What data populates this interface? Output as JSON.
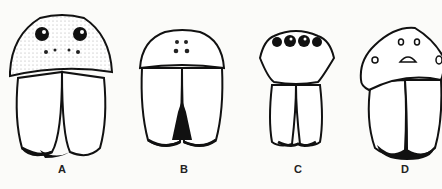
{
  "figure": {
    "panels": [
      {
        "label": "A",
        "description": "spider face with large anterior median eyes and chelicerae"
      },
      {
        "label": "B",
        "description": "spider face with small eyes and toothed chelicerae"
      },
      {
        "label": "C",
        "description": "spider face with row of large eyes on narrow carapace"
      },
      {
        "label": "D",
        "description": "spider face with peaked carapace and dark-tipped chelicerae"
      }
    ]
  }
}
